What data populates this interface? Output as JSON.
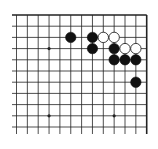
{
  "board": {
    "description": "Go board fragment (top-right corner)",
    "columns": 13,
    "rows": 12,
    "origin_x": 16.5,
    "origin_y": 15,
    "spacing_x": 10.85,
    "spacing_y": 11.2,
    "line_left_extend": 12,
    "line_bottom": 134,
    "edges": [
      "top",
      "right"
    ],
    "line_color": "#222222",
    "star_points": [
      [
        3,
        3
      ],
      [
        3,
        9
      ],
      [
        9,
        9
      ]
    ],
    "stones": [
      {
        "color": "black",
        "col": 5,
        "row": 2
      },
      {
        "color": "black",
        "col": 7,
        "row": 2
      },
      {
        "color": "white",
        "col": 8,
        "row": 2
      },
      {
        "color": "white",
        "col": 9,
        "row": 2
      },
      {
        "color": "black",
        "col": 7,
        "row": 3
      },
      {
        "color": "black",
        "col": 9,
        "row": 3
      },
      {
        "color": "white",
        "col": 10,
        "row": 3
      },
      {
        "color": "white",
        "col": 11,
        "row": 3
      },
      {
        "color": "black",
        "col": 9,
        "row": 4
      },
      {
        "color": "black",
        "col": 10,
        "row": 4
      },
      {
        "color": "black",
        "col": 11,
        "row": 4
      },
      {
        "color": "black",
        "col": 11,
        "row": 6
      }
    ]
  }
}
